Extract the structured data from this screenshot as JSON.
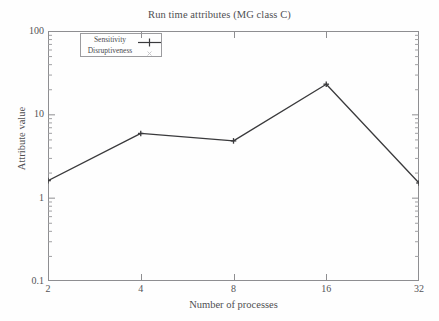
{
  "chart_data": {
    "type": "line",
    "title": "Run time attributes (MG class C)",
    "xlabel": "Number of processes",
    "ylabel": "Attribute value",
    "x": [
      2,
      4,
      8,
      16,
      32
    ],
    "xtick_labels": [
      "2",
      "4",
      "8",
      "16",
      "32"
    ],
    "ytick_labels": [
      "100",
      "10",
      "1",
      "0.1"
    ],
    "ylim": [
      0.1,
      100
    ],
    "xscale": "log2",
    "yscale": "log10",
    "grid": false,
    "legend_position": "top-left inside",
    "series": [
      {
        "name": "Sensitivity",
        "marker": "plus",
        "color": "#3a3a3c",
        "values": [
          1.6,
          5.9,
          4.8,
          23.0,
          1.5
        ]
      },
      {
        "name": "Disruptiveness",
        "marker": "cross",
        "color": "#b9b9bc",
        "values": [
          null,
          null,
          null,
          null,
          null
        ]
      }
    ]
  },
  "axis": {
    "yticks": [
      {
        "label": "100",
        "value": 100
      },
      {
        "label": "10",
        "value": 10
      },
      {
        "label": "1",
        "value": 1
      },
      {
        "label": "0.1",
        "value": 0.1
      }
    ],
    "xticks": [
      {
        "label": "2",
        "value": 2
      },
      {
        "label": "4",
        "value": 4
      },
      {
        "label": "8",
        "value": 8
      },
      {
        "label": "16",
        "value": 16
      },
      {
        "label": "32",
        "value": 32
      }
    ]
  },
  "legend": {
    "entries": [
      {
        "label": "Sensitivity"
      },
      {
        "label": "Disruptiveness"
      }
    ]
  }
}
